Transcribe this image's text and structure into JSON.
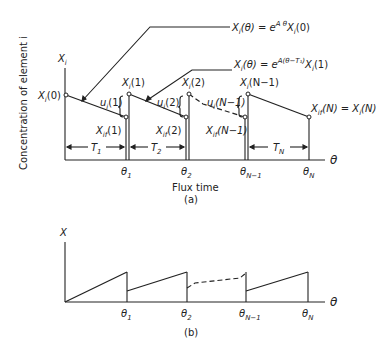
{
  "figure_a": {
    "y_axis_label": "Concentration of element i",
    "y_axis_var": "X_i",
    "x_axis_var": "θ",
    "x_axis_label": "Flux time",
    "caption": "(a)",
    "eq1": "X_i(θ) = e^{Aθ} X_i(0)",
    "eq1_main": "X",
    "eq2_main": "X",
    "labels": {
      "x0": "X_i(0)",
      "x1": "X_i(1)",
      "x2": "X_i(2)",
      "xn1": "X_i(N-1)",
      "xfN": "X_if(N) = X_i(N)",
      "u1": "u_i(1)",
      "u2": "u_i(2)",
      "un1": "u_i(N-1)",
      "xf1": "X_if(1)",
      "xf2": "X_if(2)",
      "xfn1": "X_if(N-1)",
      "T1": "T_1",
      "T2": "T_2",
      "TN": "T_N"
    },
    "ticks": [
      "θ_1",
      "θ_2",
      "θ_N-1",
      "θ_N"
    ],
    "eq2": "X_i(θ) = e^{A(θ-T_1)} X_i(1)"
  },
  "figure_b": {
    "y_axis_var": "X",
    "x_axis_var": "θ",
    "caption": "(b)",
    "ticks": [
      "θ_1",
      "θ_2",
      "θ_N-1",
      "θ_N"
    ]
  }
}
